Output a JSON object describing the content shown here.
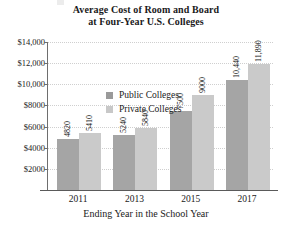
{
  "chart_data": {
    "type": "bar",
    "title": "Average Cost of Room and Board at Four-Year U.S. Colleges",
    "title_line1": "Average Cost of Room and Board",
    "title_line2": "at Four-Year U.S. Colleges",
    "xlabel": "Ending Year in the School Year",
    "ylabel": "",
    "categories": [
      "2011",
      "2013",
      "2015",
      "2017"
    ],
    "series": [
      {
        "name": "Public Colleges",
        "color": "#a5a5a5",
        "values": [
          4820,
          5240,
          7500,
          10440
        ],
        "labels": [
          "4820",
          "5240",
          "7500",
          "10,440"
        ]
      },
      {
        "name": "Private Colleges",
        "color": "#cacaca",
        "values": [
          5410,
          5840,
          9000,
          11890
        ],
        "labels": [
          "5410",
          "5840",
          "9000",
          "11,890"
        ]
      }
    ],
    "ylim": [
      0,
      14000
    ],
    "ytick_values": [
      14000,
      12000,
      10000,
      8000,
      6000,
      4000,
      2000
    ],
    "ytick_labels": [
      "$14,000",
      "$12,000",
      "$10,000",
      "$8000",
      "$6000",
      "$4000",
      "$2000"
    ],
    "grid": true,
    "legend_position": "upper-left-inside"
  },
  "legend": {
    "items": [
      {
        "label": "Public Colleges",
        "swatch": "public"
      },
      {
        "label": "Private Colleges",
        "swatch": "private"
      }
    ]
  }
}
